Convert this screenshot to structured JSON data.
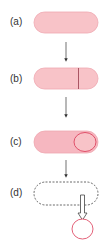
{
  "diagram": {
    "colors": {
      "cell_fill": "#f8c3c8",
      "cell_stroke": "#efa7b0",
      "wall": "#b0485a",
      "circle": "#e0506a",
      "arrow": "#333333",
      "dashed": "#444444"
    },
    "steps": [
      {
        "label": "(a)",
        "description": "rod-shaped cell"
      },
      {
        "label": "(b)",
        "description": "cell with asymmetric septum"
      },
      {
        "label": "(c)",
        "description": "forespore engulfed within cell"
      },
      {
        "label": "(d)",
        "description": "mother cell lyses, releasing spore"
      }
    ]
  }
}
